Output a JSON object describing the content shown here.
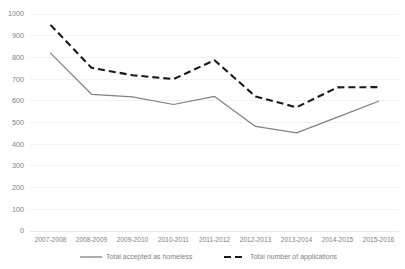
{
  "chart_data": {
    "type": "line",
    "title": "",
    "subtitle": "",
    "xlabel": "",
    "ylabel": "",
    "categories": [
      "2007-2008",
      "2008-2009",
      "2009-2010",
      "2010-2011",
      "2011-2012",
      "2012-2013",
      "2013-2014",
      "2014-2015",
      "2015-2016"
    ],
    "series": [
      {
        "name": "Total accepted as homeless",
        "style": "solid",
        "color": "#808080",
        "values": [
          820,
          630,
          618,
          583,
          620,
          482,
          452,
          525,
          598
        ]
      },
      {
        "name": "Total number of applications",
        "style": "dashed",
        "color": "#1a1a1a",
        "values": [
          950,
          752,
          718,
          700,
          787,
          620,
          570,
          662,
          663
        ]
      }
    ],
    "ylim": [
      0,
      1000
    ],
    "ytick_step": 100,
    "ytick_labels": [
      "0",
      "100",
      "200",
      "300",
      "400",
      "500",
      "600",
      "700",
      "800",
      "900",
      "1000"
    ],
    "grid": true,
    "grid_color": "#f2f2f2",
    "legend_position": "bottom",
    "background_color": "#ffffff",
    "axis_text_color": "#7f7f7f"
  }
}
